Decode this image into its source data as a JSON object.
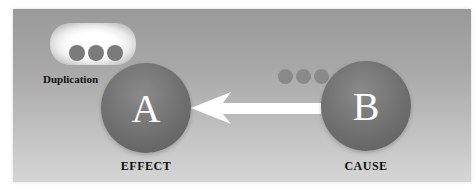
{
  "diagram": {
    "nodes": [
      {
        "id": "A",
        "letter": "A",
        "caption": "EFFECT"
      },
      {
        "id": "B",
        "letter": "B",
        "caption": "CAUSE"
      }
    ],
    "edge": {
      "from": "B",
      "to": "A",
      "direction": "right-to-left"
    },
    "annotation": {
      "label": "Duplication",
      "dots": 3
    },
    "transfer_dots": 3,
    "colors": {
      "panel": "#a8a8a8",
      "circle": "#6f6f6f",
      "dots": "#7a7a7a",
      "arrow": "#ffffff",
      "text": "#111111"
    }
  }
}
